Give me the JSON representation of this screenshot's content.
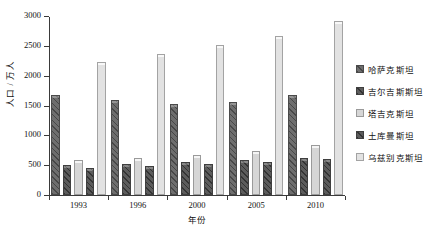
{
  "chart_data": {
    "type": "bar",
    "title": "",
    "xlabel": "年份",
    "ylabel": "人口 / 万人",
    "categories": [
      "1993",
      "1996",
      "2000",
      "2005",
      "2010"
    ],
    "ylim": [
      0,
      3000
    ],
    "yticks": [
      0,
      500,
      1000,
      1500,
      2000,
      2500,
      3000
    ],
    "ytick_labels": [
      "0",
      "500",
      "1000",
      "1500",
      "2000",
      "2500",
      "3000"
    ],
    "grid": false,
    "legend_position": "right",
    "series": [
      {
        "name": "哈萨克斯坦",
        "style": "dark",
        "color": "#6e6e6e",
        "values": [
          1670,
          1600,
          1520,
          1560,
          1670
        ]
      },
      {
        "name": "吉尔吉斯斯坦",
        "style": "darker",
        "color": "#5c5c5c",
        "values": [
          500,
          520,
          550,
          580,
          620
        ]
      },
      {
        "name": "塔吉克斯坦",
        "style": "light",
        "color": "#d6d6d6",
        "values": [
          590,
          620,
          670,
          740,
          830
        ]
      },
      {
        "name": "土库曼斯坦",
        "style": "darker",
        "color": "#5c5c5c",
        "values": [
          460,
          490,
          520,
          560,
          600
        ]
      },
      {
        "name": "乌兹别克斯坦",
        "style": "lightest",
        "color": "#e2e2e2",
        "values": [
          2230,
          2360,
          2510,
          2670,
          2920
        ]
      }
    ]
  },
  "axes": {
    "y_title": "人口 / 万人",
    "x_title": "年份"
  }
}
